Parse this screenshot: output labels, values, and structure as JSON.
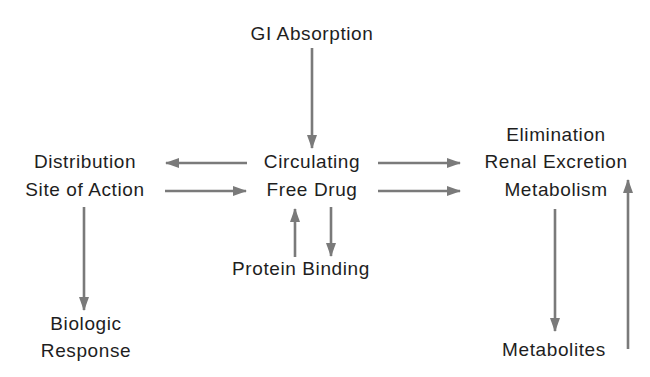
{
  "diagram": {
    "colors": {
      "arrow": "#7a7a7a",
      "text": "#1e1e1e",
      "background": "#ffffff"
    },
    "nodes": {
      "gi_absorption": {
        "label": "GI Absorption"
      },
      "circulating": {
        "line1": "Circulating",
        "line2": "Free Drug"
      },
      "distribution": {
        "line1": "Distribution",
        "line2": "Site of Action"
      },
      "elimination": {
        "line1": "Elimination",
        "line2": "Renal Excretion",
        "line3": "Metabolism"
      },
      "protein_binding": {
        "label": "Protein Binding"
      },
      "biologic_response": {
        "line1": "Biologic",
        "line2": "Response"
      },
      "metabolites": {
        "label": "Metabolites"
      }
    },
    "edges": [
      {
        "from": "GI Absorption",
        "to": "Circulating Free Drug"
      },
      {
        "from": "Circulating Free Drug",
        "to": "Distribution / Site of Action"
      },
      {
        "from": "Distribution / Site of Action",
        "to": "Circulating Free Drug"
      },
      {
        "from": "Circulating Free Drug",
        "to": "Elimination (Renal Excretion)"
      },
      {
        "from": "Circulating Free Drug",
        "to": "Elimination (Metabolism)"
      },
      {
        "from": "Protein Binding",
        "to": "Circulating Free Drug"
      },
      {
        "from": "Circulating Free Drug",
        "to": "Protein Binding"
      },
      {
        "from": "Distribution / Site of Action",
        "to": "Biologic Response"
      },
      {
        "from": "Metabolism",
        "to": "Metabolites"
      },
      {
        "from": "Metabolites",
        "to": "Renal Excretion"
      }
    ]
  }
}
